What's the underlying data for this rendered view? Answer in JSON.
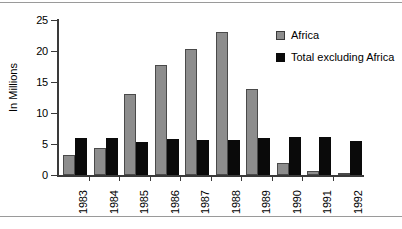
{
  "chart_data": {
    "type": "bar",
    "title": "",
    "xlabel": "",
    "ylabel": "In Millions",
    "ylim": [
      0,
      25
    ],
    "yticks": [
      0,
      5,
      10,
      15,
      20,
      25
    ],
    "grid": false,
    "legend_position": "top-right",
    "categories": [
      "1983",
      "1984",
      "1985",
      "1986",
      "1987",
      "1988",
      "1989",
      "1990",
      "1991",
      "1992"
    ],
    "series": [
      {
        "name": "Africa",
        "color": "#8d8d8d",
        "values": [
          3.2,
          4.4,
          13.0,
          17.8,
          20.4,
          23.0,
          13.8,
          2.0,
          0.7,
          0.3
        ]
      },
      {
        "name": "Total excluding Africa",
        "color": "#0a0a0a",
        "values": [
          6.0,
          6.0,
          5.3,
          5.8,
          5.6,
          5.6,
          6.0,
          6.2,
          6.2,
          5.5
        ]
      }
    ]
  },
  "legend": {
    "items": [
      {
        "label": "Africa",
        "swatch": "gray-swatch-icon"
      },
      {
        "label": "Total excluding Africa",
        "swatch": "black-swatch-icon"
      }
    ]
  },
  "axes": {
    "y_title": "In Millions",
    "y_tick_labels": [
      "25",
      "20",
      "15",
      "10",
      "5",
      "0"
    ],
    "x_tick_labels": [
      "1983",
      "1984",
      "1985",
      "1986",
      "1987",
      "1988",
      "1989",
      "1990",
      "1991",
      "1992"
    ]
  }
}
